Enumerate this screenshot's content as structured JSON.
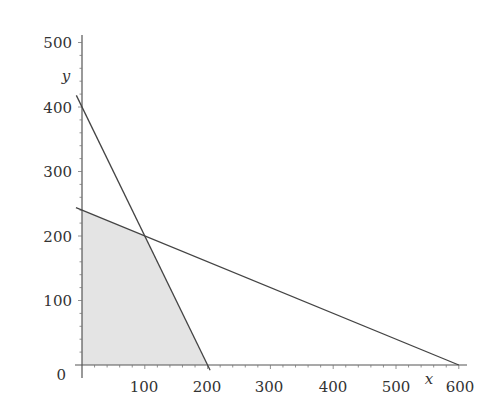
{
  "chart_data": {
    "type": "line",
    "title": "",
    "xlabel": "x",
    "ylabel": "y",
    "xlim": [
      0,
      600
    ],
    "ylim": [
      0,
      500
    ],
    "grid": false,
    "x_ticks": [
      "100",
      "200",
      "300",
      "400",
      "500",
      "600"
    ],
    "y_ticks": [
      "0",
      "100",
      "200",
      "300",
      "400",
      "500"
    ],
    "series": [
      {
        "name": "constraint-steep",
        "equation": "2x + y = 400",
        "points": [
          [
            0,
            400
          ],
          [
            200,
            0
          ]
        ]
      },
      {
        "name": "constraint-shallow",
        "equation": "2x + 5y = 1200",
        "points": [
          [
            0,
            240
          ],
          [
            600,
            0
          ]
        ]
      }
    ],
    "shaded_region": {
      "name": "feasible-region",
      "vertices": [
        [
          0,
          0
        ],
        [
          0,
          240
        ],
        [
          100,
          200
        ],
        [
          200,
          0
        ]
      ],
      "color": "#e4e4e4"
    },
    "intersection": [
      100,
      200
    ],
    "colors": {
      "line": "#444444",
      "axis": "#555555",
      "shade": "#e4e4e4"
    }
  }
}
